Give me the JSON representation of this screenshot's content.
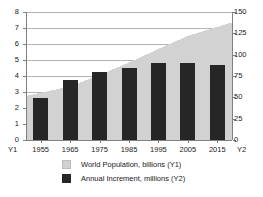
{
  "chart_data": {
    "type": "area",
    "title": "",
    "subtitle": "",
    "xlabel": "",
    "categories": [
      "1955",
      "1965",
      "1975",
      "1985",
      "1995",
      "2005",
      "2015"
    ],
    "x_axis_left_name": "Y1",
    "x_axis_right_name": "Y2",
    "grid": true,
    "legend_position": "bottom",
    "axes": [
      {
        "id": "Y1",
        "side": "left",
        "label": "World Population, billions",
        "ylim": [
          0,
          8
        ],
        "ticks": [
          0,
          1,
          2,
          3,
          4,
          5,
          6,
          7,
          8
        ],
        "tick_labels": [
          "0",
          "1",
          "2",
          "3",
          "4",
          "5",
          "6",
          "7",
          "8"
        ]
      },
      {
        "id": "Y2",
        "side": "right",
        "label": "Annual Increment, millions",
        "ylim": [
          0,
          150
        ],
        "ticks": [
          0,
          25,
          50,
          75,
          100,
          125,
          150
        ],
        "tick_labels": [
          "0",
          "25",
          "50",
          "75",
          "100",
          "125",
          "150"
        ]
      }
    ],
    "series": [
      {
        "name": "World Population, billions (Y1)",
        "type": "area",
        "axis": "Y1",
        "color": "#d2d2d2",
        "values": [
          2.75,
          3.35,
          4.07,
          4.84,
          5.69,
          6.51,
          7.35
        ]
      },
      {
        "name": "Annual Increment, millions (Y2)",
        "type": "bar",
        "axis": "Y2",
        "color": "#262626",
        "values": [
          49,
          70,
          80,
          84,
          90,
          90,
          88
        ]
      }
    ]
  },
  "legend": {
    "items": [
      {
        "label": "World Population, billions (Y1)",
        "swatch": "area",
        "color": "#d2d2d2"
      },
      {
        "label": "Annual Increment, millions (Y2)",
        "swatch": "bars",
        "color": "#262626"
      }
    ]
  },
  "colors": {
    "area_fill": "#d2d2d2",
    "bar_fill": "#262626",
    "grid": "#b4b4b4",
    "axis": "#808080",
    "text": "#1a1a1a",
    "background": "#ffffff"
  }
}
